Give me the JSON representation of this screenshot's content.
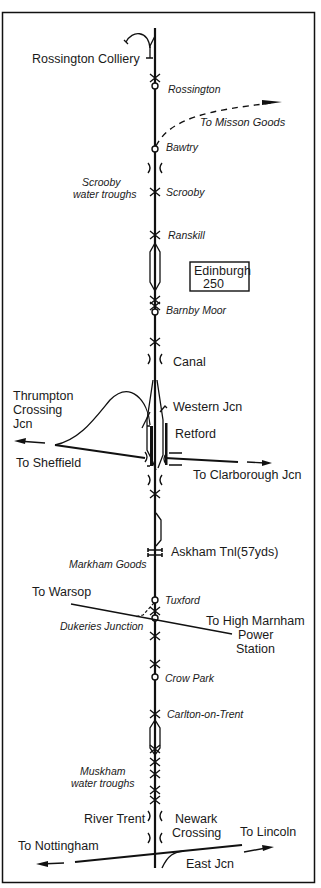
{
  "diagram": {
    "type": "railway route diagram",
    "main_line": "Rossington to Newark",
    "distance_box": {
      "line1": "Edinburgh",
      "line2": "250"
    },
    "stations": [
      {
        "name": "Rossington",
        "y": 61
      },
      {
        "name": "Bawtry",
        "y": 148
      },
      {
        "name": "Scrooby",
        "y": 192
      },
      {
        "name": "Ranskill",
        "y": 235
      },
      {
        "name": "Barnby Moor",
        "y": 311
      },
      {
        "name": "Tuxford",
        "y": 600
      },
      {
        "name": "Crow Park",
        "y": 677
      },
      {
        "name": "Carlton-on-Trent",
        "y": 714
      }
    ],
    "labels": {
      "rossington_colliery": "Rossington Colliery",
      "to_misson_goods": "To Misson Goods",
      "scrooby_troughs_1": "Scrooby",
      "scrooby_troughs_2": "water troughs",
      "canal": "Canal",
      "thrumpton_1": "Thrumpton",
      "thrumpton_2": "Crossing",
      "thrumpton_3": "Jcn",
      "western_jcn": "Western Jcn",
      "retford": "Retford",
      "to_sheffield": "To Sheffield",
      "to_clarborough": "To Clarborough Jcn",
      "askham_tnl": "Askham Tnl(57yds)",
      "markham_goods": "Markham Goods",
      "to_warsop": "To Warsop",
      "dukeries_junction": "Dukeries Junction",
      "to_high_marnham_1": "To High Marnham",
      "to_high_marnham_2": "Power",
      "to_high_marnham_3": "Station",
      "muskham_1": "Muskham",
      "muskham_2": "water troughs",
      "river_trent": "River Trent",
      "newark_1": "Newark",
      "newark_2": "Crossing",
      "to_lincoln": "To Lincoln",
      "to_nottingham": "To Nottingham",
      "east_jcn": "East Jcn"
    }
  }
}
